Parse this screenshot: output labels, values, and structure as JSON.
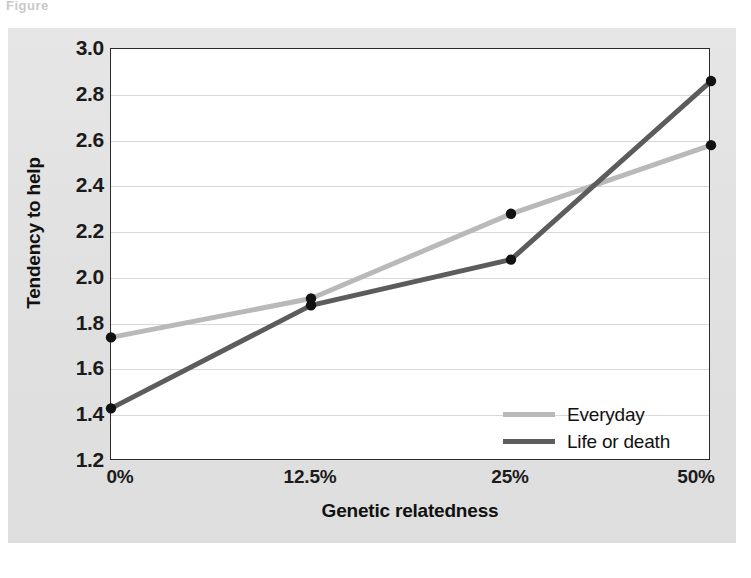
{
  "figure": {
    "top_cropped_text": "Figure",
    "panel_color": "#e3e3e3",
    "plot_background": "#ffffff",
    "frame_color": "#2b2b2b",
    "gridline_color": "#d8d8d8"
  },
  "chart_data": {
    "type": "line",
    "title": "",
    "subtitle": "",
    "xlabel": "Genetic relatedness",
    "ylabel": "Tendency to help",
    "categories": [
      "0%",
      "12.5%",
      "25%",
      "50%"
    ],
    "series": [
      {
        "name": "Everyday",
        "color": "#b9b9b9",
        "values": [
          1.74,
          1.91,
          2.28,
          2.58
        ],
        "marker": "circle",
        "marker_color": "#111111"
      },
      {
        "name": "Life or death",
        "color": "#5c5c5c",
        "values": [
          1.43,
          1.88,
          2.08,
          2.86
        ],
        "marker": "circle",
        "marker_color": "#111111"
      }
    ],
    "ylim": [
      1.2,
      3.0
    ],
    "yticks": [
      "3.0",
      "2.8",
      "2.6",
      "2.4",
      "2.2",
      "2.0",
      "1.8",
      "1.6",
      "1.4",
      "1.2"
    ],
    "ytick_values": [
      3.0,
      2.8,
      2.6,
      2.4,
      2.2,
      2.0,
      1.8,
      1.6,
      1.4,
      1.2
    ],
    "xticks": [
      "0%",
      "12.5%",
      "25%",
      "50%"
    ],
    "grid": "horizontal",
    "legend_position": "inside-bottom-right",
    "legend_entries": [
      "Everyday",
      "Life or death"
    ]
  }
}
